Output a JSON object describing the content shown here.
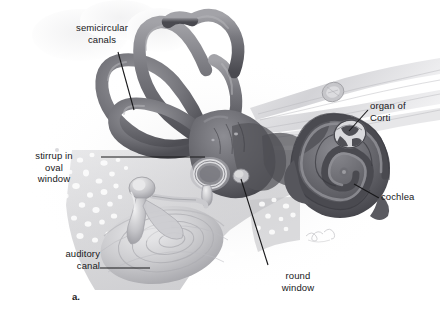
{
  "figure": {
    "figure_letter": "a.",
    "background_color": "#ffffff",
    "ink_color": "#18181a",
    "style": "grayscale airbrush anatomical illustration"
  },
  "labels": {
    "semicircular_canals": "semicircular\ncanals",
    "stirrup_in_oval_window": "stirrup in\noval\nwindow",
    "auditory_canal": "auditory\ncanal",
    "organ_of_corti": "organ of\nCorti",
    "cochlea": "cochlea",
    "round_window": "round\nwindow"
  },
  "structures": [
    {
      "name": "semicircular-canals",
      "description": "three looping bony canals of the vestibular labyrinth",
      "fill": "#6f6f74"
    },
    {
      "name": "vestibule",
      "description": "central chamber joining canals and cochlea",
      "fill": "#5e5e63"
    },
    {
      "name": "cochlea",
      "description": "spiral snail-shaped organ of hearing",
      "fill": "#5d5d62"
    },
    {
      "name": "organ-of-corti",
      "description": "cut-away cross section of cochlear duct",
      "fill": "#d8d8da"
    },
    {
      "name": "auditory-nerve",
      "description": "pale nerve fiber bundle with cut cross-section",
      "fill": "#cfcfd2"
    },
    {
      "name": "stirrup-in-oval-window",
      "description": "stapes bone seated in the oval window",
      "fill": "#bdbdc0"
    },
    {
      "name": "round-window",
      "description": "small membrane-covered opening below the oval window",
      "fill": "#cacacd"
    },
    {
      "name": "auditory-canal",
      "description": "external ear canal leading to the eardrum",
      "fill": "#c8c8cb"
    },
    {
      "name": "mastoid-bone",
      "description": "spongy trabecular temporal bone texture",
      "fill": "#b9b9bc"
    },
    {
      "name": "artist-signature",
      "description": "faint handwritten signature mark",
      "fill": "#c9c9cc"
    }
  ],
  "leader_lines": [
    {
      "name": "semicircular-canals-leader",
      "from": [
        118,
        52
      ],
      "to": [
        134,
        110
      ]
    },
    {
      "name": "stirrup-leader",
      "from": [
        101,
        157
      ],
      "to": [
        205,
        157
      ]
    },
    {
      "name": "auditory-canal-leader",
      "from": [
        100,
        268
      ],
      "to": [
        150,
        268
      ]
    },
    {
      "name": "organ-of-corti-leader",
      "from": [
        368,
        110
      ],
      "to": [
        350,
        132
      ]
    },
    {
      "name": "cochlea-leader",
      "from": [
        379,
        198
      ],
      "to": [
        355,
        185
      ]
    },
    {
      "name": "round-window-leader",
      "from": [
        268,
        265
      ],
      "to": [
        241,
        178
      ]
    }
  ]
}
